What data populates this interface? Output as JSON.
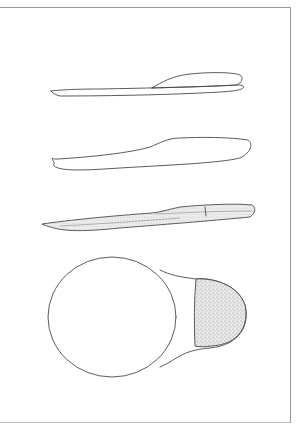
{
  "drawing": {
    "subject": "insole technical sketch",
    "views": [
      {
        "id": "side-view-layered",
        "label": "Side view (layered insole)"
      },
      {
        "id": "side-view-outline",
        "label": "Side view (outline)"
      },
      {
        "id": "side-view-shaded",
        "label": "Side view (shaded with insert)"
      },
      {
        "id": "top-view-heel-cup",
        "label": "Top view (round forefoot with stippled heel pad)"
      }
    ],
    "colors": {
      "background": "#ffffff",
      "line": "#4a4a4a",
      "frame": "#9a9a9a",
      "stipple": "#bbbbbb"
    }
  }
}
